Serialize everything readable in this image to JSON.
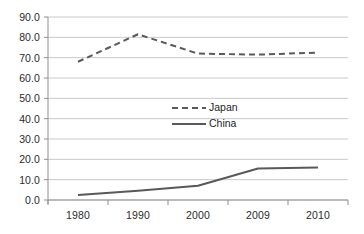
{
  "chart_data": {
    "type": "line",
    "title": "",
    "subtitle": "",
    "xlabel": "",
    "ylabel": "",
    "categories": [
      "1980",
      "1990",
      "2000",
      "2009",
      "2010"
    ],
    "ylim": [
      0.0,
      90.0
    ],
    "y_ticks": [
      "0.0",
      "10.0",
      "20.0",
      "30.0",
      "40.0",
      "50.0",
      "60.0",
      "70.0",
      "80.0",
      "90.0"
    ],
    "y_tick_values": [
      0.0,
      10.0,
      20.0,
      30.0,
      40.0,
      50.0,
      60.0,
      70.0,
      80.0,
      90.0
    ],
    "grid": true,
    "grid_axis": "y",
    "legend_position": "center",
    "series": [
      {
        "name": "Japan",
        "style": "dashed",
        "color": "#595959",
        "values": [
          68.0,
          81.5,
          72.0,
          71.5,
          72.5
        ]
      },
      {
        "name": "China",
        "style": "solid",
        "color": "#595959",
        "values": [
          2.5,
          4.5,
          7.0,
          15.5,
          16.0
        ]
      }
    ],
    "colors": {
      "gridline": "#c9c9c9",
      "axis": "#8f8f8f",
      "text": "#2b2b2b",
      "series_line": "#595959",
      "background": "#ffffff"
    }
  },
  "legend": {
    "items": [
      {
        "label": "Japan",
        "style": "dashed"
      },
      {
        "label": "China",
        "style": "solid"
      }
    ]
  }
}
